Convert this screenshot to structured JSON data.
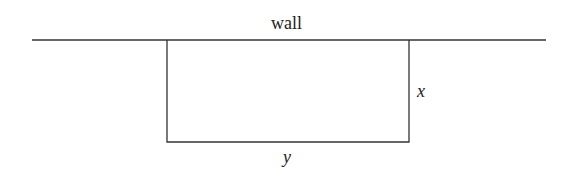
{
  "diagram": {
    "title": "",
    "labels": {
      "wall": "wall",
      "side_x": "x",
      "side_y": "y"
    },
    "colors": {
      "line": "#333333",
      "text": "#222222",
      "background": "#ffffff"
    },
    "shapes": {
      "wall_line": {
        "x1": 32,
        "y1": 40,
        "x2": 546,
        "y2": 40
      },
      "rectangle": {
        "left": 167,
        "top": 40,
        "right": 409,
        "bottom": 142,
        "open_side": "top (along wall)"
      }
    }
  }
}
